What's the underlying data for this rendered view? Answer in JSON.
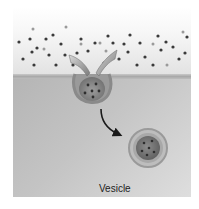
{
  "diagram": {
    "labels": {
      "vesicle": "Vesicle"
    },
    "regions": [
      "extracellular-space",
      "plasma-membrane",
      "cytoplasm"
    ],
    "elements": [
      "extracellular-particles",
      "membrane-invagination",
      "inward-arrows",
      "curved-arrow",
      "vesicle"
    ],
    "colors": {
      "background": "#ffffff",
      "extracellular_top": "#ffffff",
      "extracellular_bottom": "#e2e2e2",
      "membrane": "#a9a9a9",
      "cytoplasm": "#c4c4c4",
      "particle": "#3a3a3a",
      "arrow": "#1a1a1a",
      "label": "#222222"
    }
  }
}
